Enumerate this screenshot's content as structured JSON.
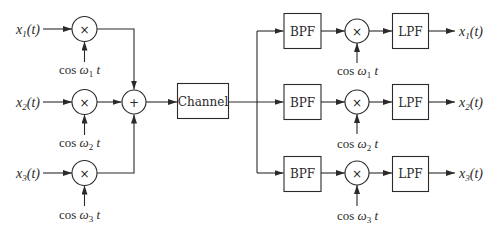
{
  "diagram": {
    "type": "FDM modulation / demodulation block diagram",
    "transmitter": {
      "inputs": [
        {
          "signal": "x",
          "index": "1",
          "suffix": "(t)"
        },
        {
          "signal": "x",
          "index": "2",
          "suffix": "(t)"
        },
        {
          "signal": "x",
          "index": "3",
          "suffix": "(t)"
        }
      ],
      "multiplier_symbol": "×",
      "carriers": [
        {
          "prefix": "cos ",
          "omega": "ω",
          "index": "1",
          "suffix": " t"
        },
        {
          "prefix": "cos ",
          "omega": "ω",
          "index": "2",
          "suffix": " t"
        },
        {
          "prefix": "cos ",
          "omega": "ω",
          "index": "3",
          "suffix": " t"
        }
      ],
      "summer_symbol": "+"
    },
    "channel": {
      "label": "Channel"
    },
    "receiver": {
      "branches": [
        {
          "bpf": "BPF",
          "mult": "×",
          "lpf": "LPF",
          "carrier": {
            "prefix": "cos ",
            "omega": "ω",
            "index": "1",
            "suffix": " t"
          },
          "output": {
            "signal": "x",
            "index": "1",
            "suffix": "(t)"
          }
        },
        {
          "bpf": "BPF",
          "mult": "×",
          "lpf": "LPF",
          "carrier": {
            "prefix": "cos ",
            "omega": "ω",
            "index": "2",
            "suffix": " t"
          },
          "output": {
            "signal": "x",
            "index": "2",
            "suffix": "(t)"
          }
        },
        {
          "bpf": "BPF",
          "mult": "×",
          "lpf": "LPF",
          "carrier": {
            "prefix": "cos ",
            "omega": "ω",
            "index": "3",
            "suffix": " t"
          },
          "output": {
            "signal": "x",
            "index": "3",
            "suffix": "(t)"
          }
        }
      ]
    }
  }
}
